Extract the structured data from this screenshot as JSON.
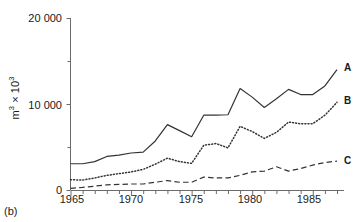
{
  "caption": "(b)",
  "axes": {
    "ylabel_text": "m",
    "ylabel_sup1": "3",
    "ylabel_mid": " × 10",
    "ylabel_sup2": "3",
    "ytick_0": "0",
    "ytick_10000": "10 000",
    "ytick_20000": "20 000",
    "xtick_1965": "1965",
    "xtick_1970": "1970",
    "xtick_1975": "1975",
    "xtick_1980": "1980",
    "xtick_1985": "1985"
  },
  "labels": {
    "series_a": "A",
    "series_b": "B",
    "series_c": "C"
  },
  "chart_data": {
    "type": "line",
    "title": "",
    "xlabel": "",
    "ylabel": "m³ × 10³",
    "xlim": [
      1965,
      1987
    ],
    "ylim": [
      0,
      20000
    ],
    "ytick_values": [
      0,
      10000,
      20000
    ],
    "yminor_tick_values": [
      5000,
      15000
    ],
    "xtick_values": [
      1965,
      1970,
      1975,
      1980,
      1985
    ],
    "xminor_tick_step": 1,
    "grid": false,
    "legend": "inline-right-end-labels",
    "x": [
      1965,
      1966,
      1967,
      1968,
      1969,
      1970,
      1971,
      1972,
      1973,
      1974,
      1975,
      1976,
      1977,
      1978,
      1979,
      1980,
      1981,
      1982,
      1983,
      1984,
      1985,
      1986,
      1987
    ],
    "series": [
      {
        "name": "A",
        "style": "solid",
        "color": "#333333",
        "values": [
          3050,
          3050,
          3300,
          3900,
          4050,
          4300,
          4400,
          5700,
          7600,
          6900,
          6200,
          8700,
          8700,
          8750,
          11800,
          10800,
          9600,
          10600,
          11700,
          11100,
          11100,
          12100,
          14000
        ]
      },
      {
        "name": "B",
        "style": "dotted",
        "color": "#333333",
        "values": [
          1200,
          1150,
          1400,
          1700,
          1900,
          2100,
          2400,
          3000,
          3700,
          3300,
          3100,
          5200,
          5400,
          4900,
          7400,
          6800,
          6000,
          6700,
          7900,
          7700,
          7700,
          8700,
          10200
        ]
      },
      {
        "name": "C",
        "style": "dashed",
        "color": "#333333",
        "values": [
          200,
          300,
          450,
          600,
          650,
          700,
          700,
          900,
          1100,
          900,
          900,
          1500,
          1400,
          1400,
          1700,
          2100,
          2200,
          2700,
          2200,
          2500,
          2900,
          3200,
          3350
        ]
      }
    ]
  }
}
